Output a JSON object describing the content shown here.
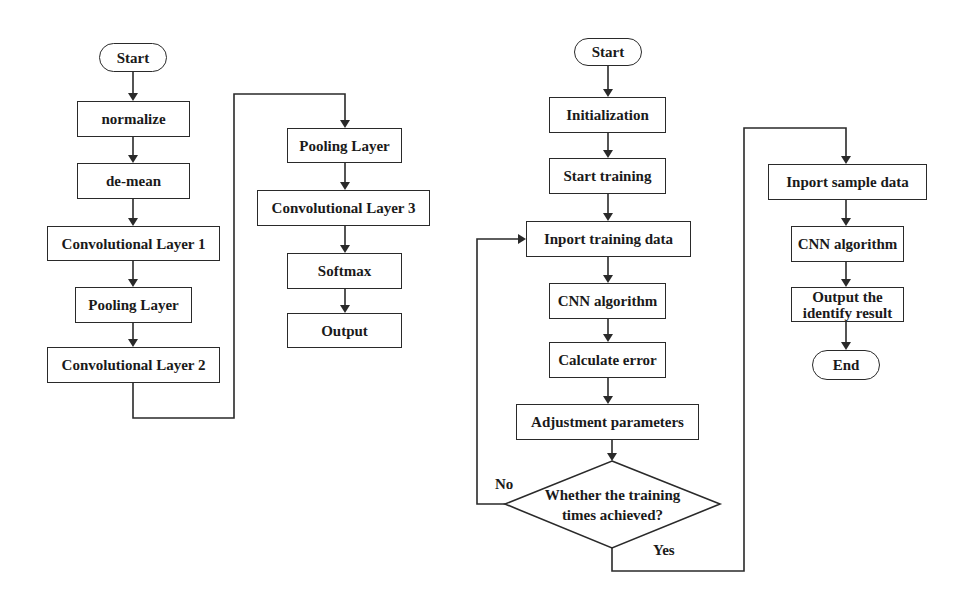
{
  "left_flowchart": {
    "start": "Start",
    "steps": [
      "normalize",
      "de-mean",
      "Convolutional Layer 1",
      "Pooling Layer",
      "Convolutional Layer 2"
    ]
  },
  "middle_flowchart": {
    "steps": [
      "Pooling Layer",
      "Convolutional Layer 3",
      "Softmax",
      "Output"
    ]
  },
  "training_flowchart": {
    "start": "Start",
    "steps": [
      "Initialization",
      "Start training",
      "Inport training data",
      "CNN algorithm",
      "Calculate error",
      "Adjustment parameters"
    ],
    "decision": {
      "line1": "Whether the training",
      "line2": "times achieved?",
      "no_label": "No",
      "yes_label": "Yes"
    }
  },
  "identification_flowchart": {
    "steps": [
      "Inport sample data",
      "CNN algorithm"
    ],
    "output_line1": "Output the",
    "output_line2": "identify result",
    "end": "End"
  },
  "colors": {
    "stroke": "#2a2a2a",
    "background": "#ffffff",
    "text": "#1a1a1a"
  }
}
